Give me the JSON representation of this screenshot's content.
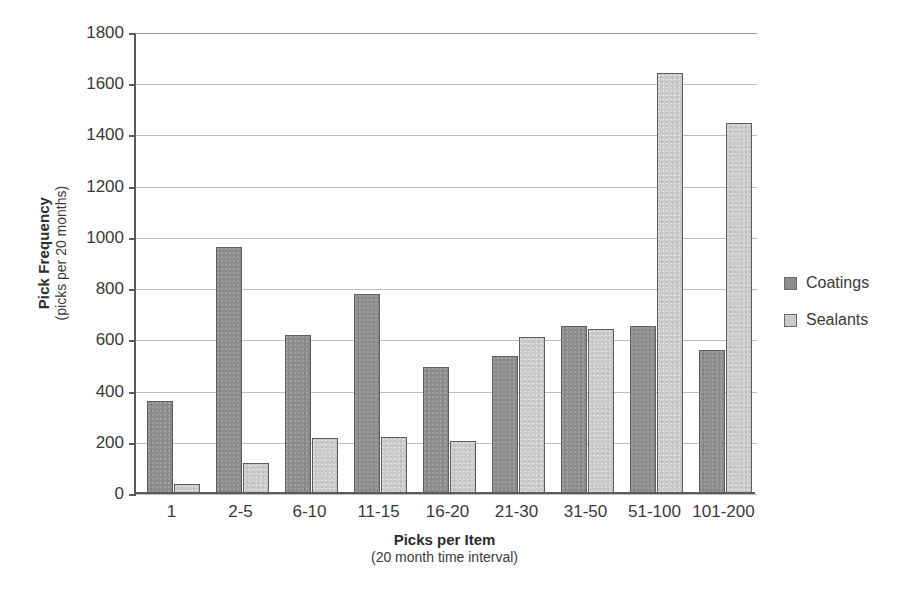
{
  "chart_data": {
    "type": "bar",
    "title": "",
    "xlabel": "Picks per Item",
    "xlabel_sub": "(20 month time interval)",
    "ylabel": "Pick Frequency",
    "ylabel_sub": "(picks per 20 months)",
    "categories": [
      "1",
      "2-5",
      "6-10",
      "11-15",
      "16-20",
      "21-30",
      "31-50",
      "51-100",
      "101-200"
    ],
    "series": [
      {
        "name": "Coatings",
        "color": "#8d8d8d",
        "values": [
          355,
          955,
          615,
          775,
          490,
          532,
          650,
          650,
          553
        ]
      },
      {
        "name": "Sealants",
        "color": "#cbcbcb",
        "values": [
          30,
          115,
          210,
          215,
          198,
          605,
          637,
          1637,
          1442
        ]
      }
    ],
    "ylim": [
      0,
      1800
    ],
    "ytick_step": 200,
    "yticks": [
      "0",
      "200",
      "400",
      "600",
      "800",
      "1000",
      "1200",
      "1400",
      "1600",
      "1800"
    ],
    "grid": true,
    "legend_position": "right"
  },
  "legend": {
    "items": [
      {
        "label": "Coatings"
      },
      {
        "label": "Sealants"
      }
    ]
  }
}
